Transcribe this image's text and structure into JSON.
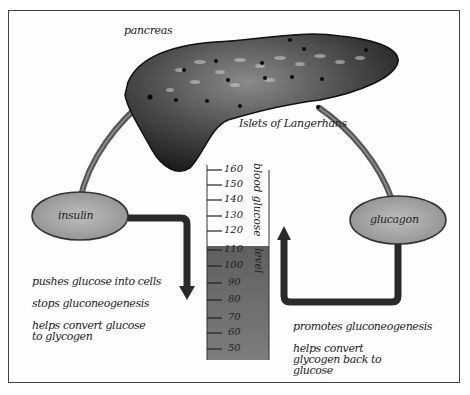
{
  "diagram": {
    "title_label": "pancreas",
    "islets_label": "Islets of Langerhans",
    "hormones": {
      "insulin": {
        "label": "insulin",
        "effects": [
          "pushes glucose into cells",
          "stops gluconeogenesis",
          "helps convert glucose to glycogen"
        ]
      },
      "glucagon": {
        "label": "glucagon",
        "effects": [
          "promotes gluconeogenesis",
          "helps convert glycogen back to glucose"
        ]
      }
    },
    "gauge": {
      "label_top": "blood glucose",
      "label_bottom": "level",
      "ticks": [
        "160",
        "150",
        "140",
        "130",
        "120",
        "110",
        "100",
        "90",
        "80",
        "70",
        "60",
        "50"
      ],
      "fill_level": 110,
      "fill_color": "#6e6e6e"
    },
    "colors": {
      "pancreas": "#2b2b2b",
      "ellipse": "#a9a9a9",
      "arrow": "#2a2a2a",
      "border": "#444444"
    }
  }
}
